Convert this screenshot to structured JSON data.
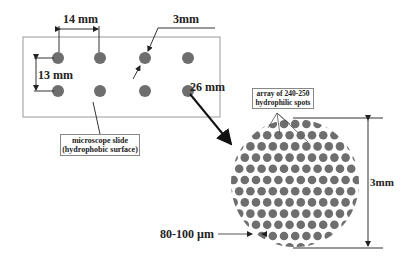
{
  "diagram": {
    "slide": {
      "spacing_horizontal_label": "14 mm",
      "spacing_vertical_label": "13 mm",
      "spot_diameter_label": "3mm",
      "slide_width_label": "26 mm",
      "spots_per_row": 4,
      "rows": 2,
      "caption_line1": "microscope slide",
      "caption_line2": "(hydrophobic surface)"
    },
    "zoom_view": {
      "array_label_line1": "array of 240-250",
      "array_label_line2": "hydrophilic spots",
      "diameter_label": "3mm",
      "spot_size_label": "80-100 µm"
    },
    "colors": {
      "spot": "#6e6e6e",
      "line": "#333333",
      "slide_border": "#888888"
    }
  }
}
